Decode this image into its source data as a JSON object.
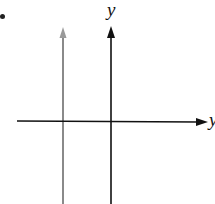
{
  "diagram": {
    "axes": {
      "y_label": "y",
      "x_label": "y"
    },
    "lines": [
      {
        "name": "vertical-line-gray",
        "color": "#8a8a8a"
      },
      {
        "name": "y-axis",
        "color": "#111111"
      }
    ],
    "x_axis_color": "#111111"
  }
}
